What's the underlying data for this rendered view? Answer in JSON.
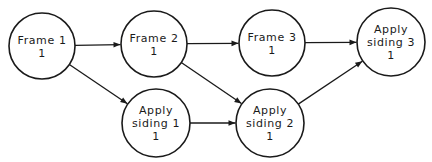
{
  "diagram": {
    "type": "activity-network",
    "nodes": [
      {
        "id": "frame1",
        "lines": [
          "Frame 1",
          "1"
        ],
        "cx": 42,
        "cy": 46,
        "r": 33
      },
      {
        "id": "frame2",
        "lines": [
          "Frame 2",
          "1"
        ],
        "cx": 154,
        "cy": 44,
        "r": 33
      },
      {
        "id": "frame3",
        "lines": [
          "Frame 3",
          "1"
        ],
        "cx": 272,
        "cy": 43,
        "r": 33
      },
      {
        "id": "siding3",
        "lines": [
          "Apply",
          "siding 3",
          "1"
        ],
        "cx": 391,
        "cy": 42,
        "r": 34
      },
      {
        "id": "siding1",
        "lines": [
          "Apply",
          "siding 1",
          "1"
        ],
        "cx": 156,
        "cy": 123,
        "r": 34
      },
      {
        "id": "siding2",
        "lines": [
          "Apply",
          "siding 2",
          "1"
        ],
        "cx": 270,
        "cy": 123,
        "r": 34
      }
    ],
    "edges": [
      {
        "from": "frame1",
        "to": "frame2"
      },
      {
        "from": "frame2",
        "to": "frame3"
      },
      {
        "from": "frame3",
        "to": "siding3"
      },
      {
        "from": "frame1",
        "to": "siding1"
      },
      {
        "from": "frame2",
        "to": "siding2"
      },
      {
        "from": "siding1",
        "to": "siding2"
      },
      {
        "from": "siding2",
        "to": "siding3"
      }
    ]
  }
}
